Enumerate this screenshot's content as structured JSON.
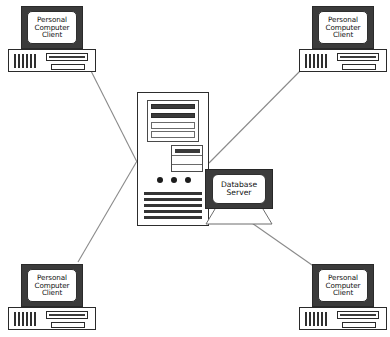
{
  "diagram": {
    "background_color": "#ffffff",
    "line_color": "#8a8a8a",
    "icon_dark": "#3b3b3b",
    "icon_outline": "#2a2a2a",
    "label_text_color": "#101010"
  },
  "server": {
    "name": "central-server-tower",
    "dot_count": 3,
    "bottom_line_count": 5,
    "top_bar_count": 2,
    "top_row_count": 2
  },
  "database": {
    "line1": "Database",
    "line2": "Server",
    "full_label": "Database Server"
  },
  "clients": [
    {
      "id": "client-top-left",
      "line1": "Personal",
      "line2": "Computer",
      "line3": "Client",
      "full_label": "Personal Computer Client"
    },
    {
      "id": "client-top-right",
      "line1": "Personal",
      "line2": "Computer",
      "line3": "Client",
      "full_label": "Personal Computer Client"
    },
    {
      "id": "client-bottom-left",
      "line1": "Personal",
      "line2": "Computer",
      "line3": "Client",
      "full_label": "Personal Computer Client"
    },
    {
      "id": "client-bottom-right",
      "line1": "Personal",
      "line2": "Computer",
      "line3": "Client",
      "full_label": "Personal Computer Client"
    }
  ],
  "connections": [
    {
      "from": "client-top-left",
      "to": "central-server-tower"
    },
    {
      "from": "client-top-right",
      "to": "central-server-tower"
    },
    {
      "from": "client-bottom-left",
      "to": "central-server-tower"
    },
    {
      "from": "client-bottom-right",
      "to": "database-server"
    }
  ]
}
